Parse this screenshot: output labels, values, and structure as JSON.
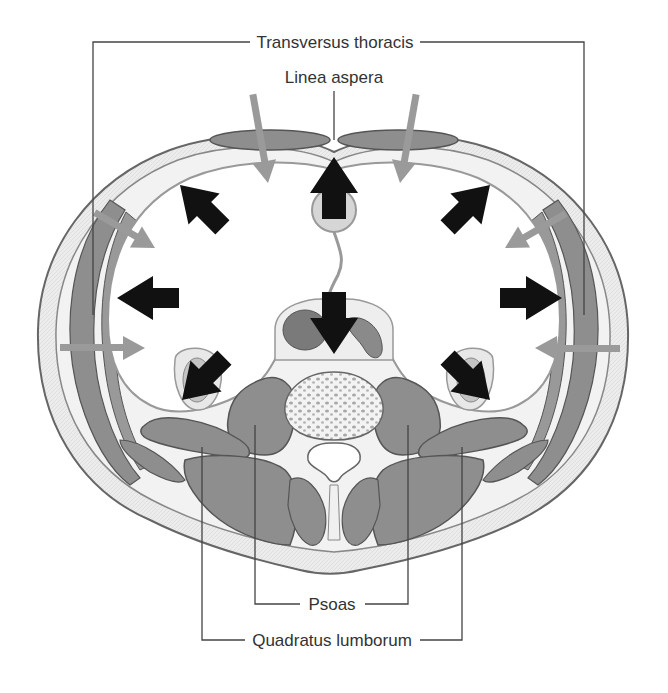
{
  "figure": {
    "type": "anatomical cross-section (abdomen, transverse)",
    "labels": {
      "top_primary": "Transversus thoracis",
      "top_secondary": "Linea aspera",
      "bottom_primary": "Psoas",
      "bottom_secondary": "Quadratus lumborum"
    },
    "arrows": {
      "black_outward_count": 8,
      "gray_inward_count": 6
    },
    "colors": {
      "muscle": "#8e8e8e",
      "muscle_outline": "#555555",
      "fat_band": "#e9e9e9",
      "outline": "#6a6a6a",
      "black_arrow": "#111111",
      "gray_arrow": "#9a9a9a",
      "label_text": "#333333",
      "leader_line": "#444444"
    }
  }
}
